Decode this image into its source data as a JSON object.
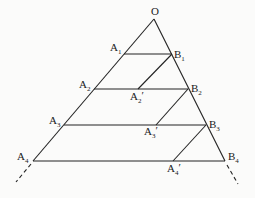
{
  "diagram": {
    "type": "geometric-construction",
    "colors": {
      "line": "#222222",
      "text": "#1a1a1a",
      "background": "#fbfbfa"
    },
    "points": {
      "O": {
        "label": "O",
        "sub": "",
        "prime": "",
        "x": 154,
        "y": 19
      },
      "A1": {
        "label": "A",
        "sub": "1",
        "prime": "",
        "x": 124,
        "y": 54
      },
      "B1": {
        "label": "B",
        "sub": "1",
        "prime": "",
        "x": 172,
        "y": 54
      },
      "A2": {
        "label": "A",
        "sub": "2",
        "prime": "",
        "x": 94,
        "y": 89
      },
      "A2p": {
        "label": "A",
        "sub": "2",
        "prime": "′",
        "x": 138,
        "y": 89
      },
      "B2": {
        "label": "B",
        "sub": "2",
        "prime": "",
        "x": 188,
        "y": 89
      },
      "A3": {
        "label": "A",
        "sub": "3",
        "prime": "",
        "x": 64,
        "y": 125
      },
      "A3p": {
        "label": "A",
        "sub": "3",
        "prime": "′",
        "x": 156,
        "y": 125
      },
      "B3": {
        "label": "B",
        "sub": "3",
        "prime": "",
        "x": 206,
        "y": 125
      },
      "A4": {
        "label": "A",
        "sub": "4",
        "prime": "",
        "x": 33,
        "y": 161
      },
      "A4p": {
        "label": "A",
        "sub": "4",
        "prime": "′",
        "x": 173,
        "y": 161
      },
      "B4": {
        "label": "B",
        "sub": "4",
        "prime": "",
        "x": 225,
        "y": 161
      }
    },
    "segments": [
      [
        "O",
        "A4"
      ],
      [
        "O",
        "B4"
      ],
      [
        "A1",
        "B1"
      ],
      [
        "A2",
        "B2"
      ],
      [
        "A3",
        "B3"
      ],
      [
        "A4",
        "B4"
      ],
      [
        "B1",
        "A2p"
      ],
      [
        "B2",
        "A3p"
      ],
      [
        "B3",
        "A4p"
      ]
    ],
    "dashed_extensions": [
      {
        "from": "A4",
        "to_x": 16,
        "to_y": 182
      },
      {
        "from": "B4",
        "to_x": 238,
        "to_y": 184
      }
    ]
  }
}
